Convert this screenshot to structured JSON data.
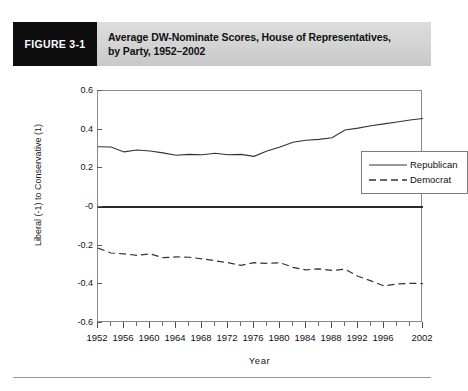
{
  "figure": {
    "tag": "FIGURE 3-1",
    "title_line1": "Average DW-Nominate Scores, House of Representatives,",
    "title_line2": "by Party, 1952–2002",
    "tag_bg": "#0d0d0d",
    "banner_bg": "#d3d3d3"
  },
  "chart_data": {
    "type": "line",
    "title": "Average DW-Nominate Scores, House of Representatives, by Party, 1952–2002",
    "xlabel": "Year",
    "ylabel": "Liberal (-1) to Conservative (1)",
    "xlim": [
      1952,
      2002
    ],
    "ylim": [
      -0.6,
      0.6
    ],
    "ytick_labels": [
      "0.6",
      "0.4",
      "0.2",
      "-0",
      "-0.2",
      "-0.4",
      "-0.6"
    ],
    "ytick_values": [
      0.6,
      0.4,
      0.2,
      0,
      -0.2,
      -0.4,
      -0.6
    ],
    "xtick_labels": [
      "1952",
      "1956",
      "1960",
      "1964",
      "1968",
      "1972",
      "1976",
      "1980",
      "1984",
      "1988",
      "1992",
      "1996",
      "2002"
    ],
    "xtick_values": [
      1952,
      1956,
      1960,
      1964,
      1968,
      1972,
      1976,
      1980,
      1984,
      1988,
      1992,
      1996,
      2002
    ],
    "xtick_minor_values": [
      1954,
      1958,
      1962,
      1966,
      1970,
      1974,
      1978,
      1982,
      1986,
      1990,
      1994,
      1998,
      2000
    ],
    "grid": false,
    "zero_reference_line": true,
    "legend_position": "upper-right-inside",
    "x": [
      1952,
      1954,
      1956,
      1958,
      1960,
      1962,
      1964,
      1966,
      1968,
      1970,
      1972,
      1974,
      1976,
      1978,
      1980,
      1982,
      1984,
      1986,
      1988,
      1990,
      1992,
      1994,
      1996,
      1998,
      2000,
      2002
    ],
    "series": [
      {
        "name": "Republican",
        "style": "solid",
        "color": "#333333",
        "values": [
          0.312,
          0.31,
          0.285,
          0.295,
          0.29,
          0.28,
          0.268,
          0.272,
          0.27,
          0.278,
          0.27,
          0.272,
          0.262,
          0.29,
          0.31,
          0.335,
          0.345,
          0.35,
          0.358,
          0.398,
          0.408,
          0.42,
          0.43,
          0.44,
          0.45,
          0.458
        ]
      },
      {
        "name": "Democrat",
        "style": "dashed",
        "color": "#333333",
        "values": [
          -0.212,
          -0.238,
          -0.242,
          -0.25,
          -0.242,
          -0.262,
          -0.258,
          -0.26,
          -0.268,
          -0.278,
          -0.288,
          -0.302,
          -0.288,
          -0.292,
          -0.288,
          -0.312,
          -0.325,
          -0.32,
          -0.328,
          -0.322,
          -0.358,
          -0.382,
          -0.408,
          -0.398,
          -0.395,
          -0.396
        ]
      }
    ]
  },
  "legend": {
    "items": [
      {
        "label": "Republican",
        "style": "solid"
      },
      {
        "label": "Democrat",
        "style": "dashed"
      }
    ]
  }
}
